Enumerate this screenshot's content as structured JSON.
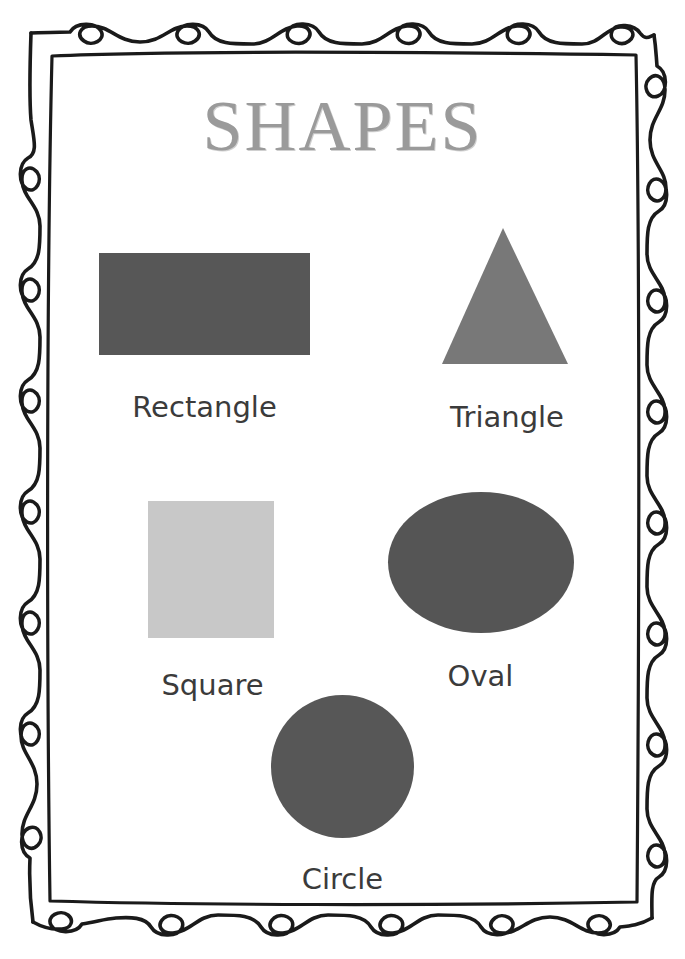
{
  "poster": {
    "title": "SHAPES",
    "title_color": "#9a9a9a",
    "background_color": "#ffffff",
    "border_color": "#1a1a1a",
    "border_style": "hand-drawn-double-line-with-loops",
    "width": 685,
    "height": 959
  },
  "shapes": [
    {
      "id": "rectangle",
      "label": "Rectangle",
      "geometry": "rectangle",
      "color": "#575757",
      "x": 99,
      "y": 253,
      "width": 211,
      "height": 102
    },
    {
      "id": "triangle",
      "label": "Triangle",
      "geometry": "triangle",
      "color": "#787878",
      "x": 440,
      "y": 222,
      "width": 130,
      "height": 145
    },
    {
      "id": "square",
      "label": "Square",
      "geometry": "square",
      "color": "#c8c8c8",
      "x": 148,
      "y": 501,
      "width": 126,
      "height": 137
    },
    {
      "id": "oval",
      "label": "Oval",
      "geometry": "ellipse",
      "color": "#555555",
      "x": 388,
      "y": 492,
      "width": 186,
      "height": 141
    },
    {
      "id": "circle",
      "label": "Circle",
      "geometry": "circle",
      "color": "#575757",
      "x": 271,
      "y": 695,
      "width": 143,
      "height": 143
    }
  ],
  "label_color": "#3b3b3b"
}
